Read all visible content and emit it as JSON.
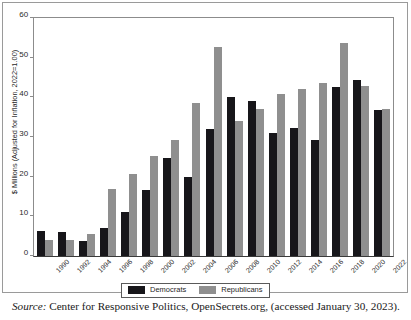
{
  "chart_data": {
    "type": "bar",
    "title": "",
    "subtitle": "",
    "xlabel": "",
    "ylabel": "$ Millions (Adjusted for Inflation, 2022=1.00)",
    "ylim": [
      0,
      60
    ],
    "yticks": [
      0,
      10,
      20,
      30,
      40,
      50,
      60
    ],
    "ytick_labels": [
      "0",
      "10",
      "20",
      "30",
      "40",
      "50",
      "60"
    ],
    "grid": false,
    "legend_position": "bottom-center",
    "categories": [
      "1990",
      "1992",
      "1994",
      "1996",
      "1998",
      "2000",
      "2002",
      "2004",
      "2006",
      "2008",
      "2010",
      "2012",
      "2014",
      "2016",
      "2018",
      "2020",
      "2022"
    ],
    "series": [
      {
        "name": "Democrats",
        "color": "#17161a",
        "values": [
          6.3,
          6.0,
          3.8,
          7.0,
          11.0,
          16.7,
          24.8,
          20.0,
          31.9,
          40.0,
          39.2,
          31.0,
          32.2,
          29.3,
          42.6,
          44.3,
          36.7
        ]
      },
      {
        "name": "Republicans",
        "color": "#8f8f8f",
        "values": [
          4.0,
          4.0,
          5.6,
          16.8,
          20.7,
          25.1,
          29.2,
          38.5,
          52.8,
          34.1,
          37.0,
          40.9,
          42.2,
          43.7,
          53.7,
          42.9,
          37.0
        ]
      }
    ],
    "annotations": []
  },
  "legend": {
    "entries": [
      {
        "label": "Democrats",
        "swatch": "dem"
      },
      {
        "label": "Republicans",
        "swatch": "rep"
      }
    ]
  },
  "source": {
    "label": "Source:",
    "text": " Center for Responsive Politics, OpenSecrets.org, (accessed January 30, 2023)."
  },
  "colors": {
    "democrats": "#17161a",
    "republicans": "#8f8f8f",
    "axis": "#8c8c8c",
    "baseline": "#3a3a3a",
    "frame": "#9a9a9a"
  }
}
